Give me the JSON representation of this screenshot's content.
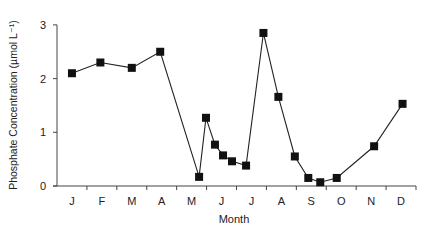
{
  "chart_data": {
    "type": "line",
    "title": "",
    "xlabel": "Month",
    "ylabel": "Phosphate Concentration  (µmol L⁻¹)",
    "ylim": [
      0,
      3
    ],
    "xlim": [
      0,
      12
    ],
    "yticks": [
      0,
      1,
      2,
      3
    ],
    "xtick_labels": [
      "J",
      "F",
      "M",
      "A",
      "M",
      "J",
      "J",
      "A",
      "S",
      "O",
      "N",
      "D"
    ],
    "grid": false,
    "legend": null,
    "marker": "square",
    "series": [
      {
        "name": "Phosphate",
        "x": [
          0.5,
          1.45,
          2.5,
          3.45,
          4.75,
          4.98,
          5.28,
          5.55,
          5.85,
          6.32,
          6.9,
          7.4,
          7.95,
          8.4,
          8.8,
          9.35,
          10.6,
          11.55
        ],
        "values": [
          2.1,
          2.3,
          2.2,
          2.5,
          0.17,
          1.27,
          0.77,
          0.57,
          0.46,
          0.38,
          2.85,
          1.66,
          0.55,
          0.15,
          0.07,
          0.15,
          0.74,
          1.53
        ]
      }
    ]
  },
  "axis": {
    "x0": 57,
    "x1": 416,
    "y0": 186,
    "y_per_unit": 53.7
  }
}
